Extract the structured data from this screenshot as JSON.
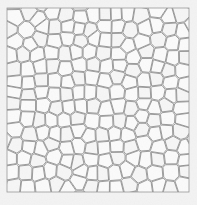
{
  "figure": {
    "title": "Voronoi Mosaic Tessellation",
    "type": "voronoi-tessellation"
  },
  "canvas": {
    "width": 197,
    "height": 205,
    "page_background": "#f3f3f3"
  },
  "panel": {
    "x": 7,
    "y": 8,
    "width": 182,
    "height": 184,
    "border_color": "#9a9a9a",
    "border_width": 0.8,
    "background": "#fdfdfd"
  },
  "cells": {
    "count_approx": 196,
    "columns": 14,
    "rows": 14,
    "fill": "#fbfbfb",
    "fill_alt": "#f6f6f6",
    "stroke": "#7d7d7d",
    "stroke_width": 0.75,
    "gap": 0.55,
    "jitter": 0.42,
    "relaxation_steps": 2,
    "seed": 20240617
  },
  "texture": {
    "noise_opacity": 0.05,
    "noise_color": "#b8b8b8"
  },
  "legend": {
    "visible": false,
    "entries": []
  },
  "axes": {
    "visible": false,
    "xlabel": "",
    "ylabel": ""
  }
}
